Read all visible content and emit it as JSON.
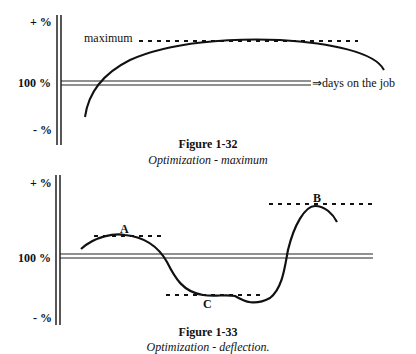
{
  "figures": [
    {
      "id": "1-32",
      "caption_title": "Figure 1-32",
      "caption_subtitle": "Optimization - maximum",
      "y_axis": {
        "top_label": "+ %",
        "middle_label": "100 %",
        "bottom_label": "- %"
      },
      "x_axis_label": "⇒days on the job",
      "annotations": [
        {
          "label": "maximum",
          "type": "dashed-level"
        }
      ]
    },
    {
      "id": "1-33",
      "caption_title": "Figure 1-33",
      "caption_subtitle": "Optimization - deflection.",
      "y_axis": {
        "top_label": "+ %",
        "middle_label": "100 %",
        "bottom_label": "- %"
      },
      "annotations": [
        {
          "label": "A",
          "type": "local-maximum"
        },
        {
          "label": "B",
          "type": "local-maximum"
        },
        {
          "label": "C",
          "type": "local-minimum"
        }
      ]
    }
  ]
}
